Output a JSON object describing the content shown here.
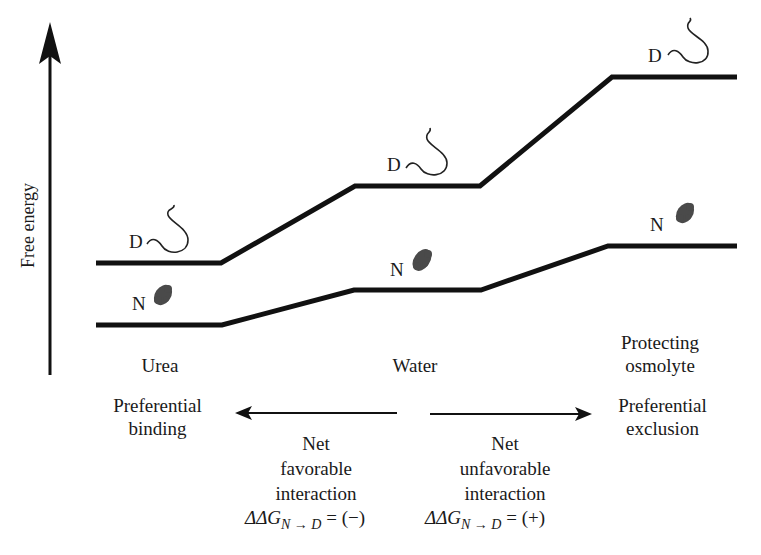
{
  "axis": {
    "label": "Free energy",
    "direction": "up"
  },
  "conditions": [
    {
      "id": "urea",
      "label": "Urea",
      "interaction": [
        "Preferential",
        "binding"
      ]
    },
    {
      "id": "water",
      "label": "Water"
    },
    {
      "id": "osmolyte",
      "label_lines": [
        "Protecting",
        "osmolyte"
      ],
      "interaction": [
        "Preferential",
        "exclusion"
      ]
    }
  ],
  "states": {
    "denatured": "D",
    "native": "N"
  },
  "levels": {
    "denatured_line": [
      [
        96,
        263
      ],
      [
        221,
        263
      ],
      [
        355,
        186
      ],
      [
        480,
        186
      ],
      [
        612,
        77
      ],
      [
        737,
        77
      ]
    ],
    "native_line": [
      [
        96,
        325
      ],
      [
        222,
        325
      ],
      [
        354,
        290
      ],
      [
        481,
        290
      ],
      [
        608,
        246
      ],
      [
        737,
        246
      ]
    ]
  },
  "arrows": {
    "left": {
      "label": [
        "Net",
        "favorable",
        "interaction"
      ],
      "equation_prefix": "ΔΔG",
      "equation_sub": "N → D",
      "equation_suffix": " = (−)"
    },
    "right": {
      "label": [
        "Net",
        "unfavorable",
        "interaction"
      ],
      "equation_prefix": "ΔΔG",
      "equation_sub": "N → D",
      "equation_suffix": " = (+)"
    }
  },
  "colors": {
    "line": "#111111",
    "protein": "#444444",
    "text": "#1a1a1a"
  }
}
